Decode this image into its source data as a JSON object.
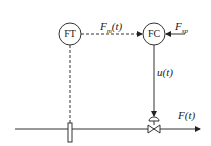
{
  "diagram": {
    "transmitter": {
      "label": "FT"
    },
    "controller": {
      "label": "FC"
    },
    "signals": {
      "measured": {
        "symbol": "F",
        "sub": "m",
        "arg": "(t)"
      },
      "setpoint": {
        "symbol": "F",
        "sub": "sp"
      },
      "control": {
        "text": "u(t)"
      },
      "flow": {
        "text": "F(t)"
      }
    }
  }
}
